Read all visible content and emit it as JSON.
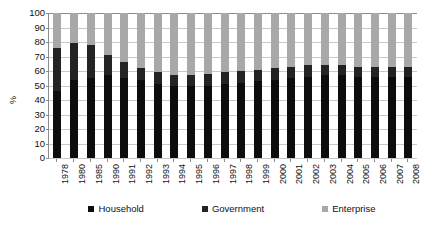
{
  "chart_data": {
    "type": "bar",
    "title": "",
    "xlabel": "",
    "ylabel": "%",
    "ylim": [
      0,
      100
    ],
    "ytick_step": 10,
    "yticks": [
      100,
      90,
      80,
      70,
      60,
      50,
      40,
      30,
      20,
      10,
      0
    ],
    "grid": true,
    "stacked": true,
    "stack_total": 100,
    "legend_position": "bottom",
    "categories": [
      "1978",
      "1980",
      "1985",
      "1990",
      "1991",
      "1992",
      "1993",
      "1994",
      "1995",
      "1996",
      "1997",
      "1998",
      "1999",
      "2000",
      "2001",
      "2002",
      "2003",
      "2004",
      "2005",
      "2006",
      "2007",
      "2008"
    ],
    "series": [
      {
        "name": "Household",
        "color": "#0d0d0d",
        "values": [
          46,
          54,
          55,
          57,
          55,
          54,
          51,
          50,
          50,
          50,
          51,
          52,
          53,
          54,
          55,
          56,
          57,
          57,
          56,
          56,
          56,
          56
        ]
      },
      {
        "name": "Government",
        "color": "#232323",
        "values": [
          30,
          25,
          23,
          14,
          11,
          8,
          8,
          7,
          7,
          8,
          8,
          8,
          8,
          8,
          8,
          8,
          7,
          7,
          7,
          7,
          7,
          7
        ]
      },
      {
        "name": "Enterprise",
        "color": "#a8a8a8",
        "values": [
          24,
          21,
          22,
          29,
          34,
          38,
          41,
          43,
          43,
          42,
          41,
          40,
          39,
          38,
          37,
          36,
          36,
          36,
          37,
          37,
          37,
          37
        ]
      }
    ],
    "bar_totals_non_enterprise": [
      76,
      79,
      78,
      71,
      66,
      62,
      59,
      57,
      57,
      58,
      59,
      60,
      61,
      62,
      63,
      64,
      64,
      64,
      63,
      63,
      63,
      63
    ]
  },
  "legend": {
    "items": [
      {
        "label": "Household",
        "color": "#0d0d0d"
      },
      {
        "label": "Government",
        "color": "#232323"
      },
      {
        "label": "Enterprise",
        "color": "#a8a8a8"
      }
    ]
  },
  "axes": {
    "y_title": "%"
  }
}
